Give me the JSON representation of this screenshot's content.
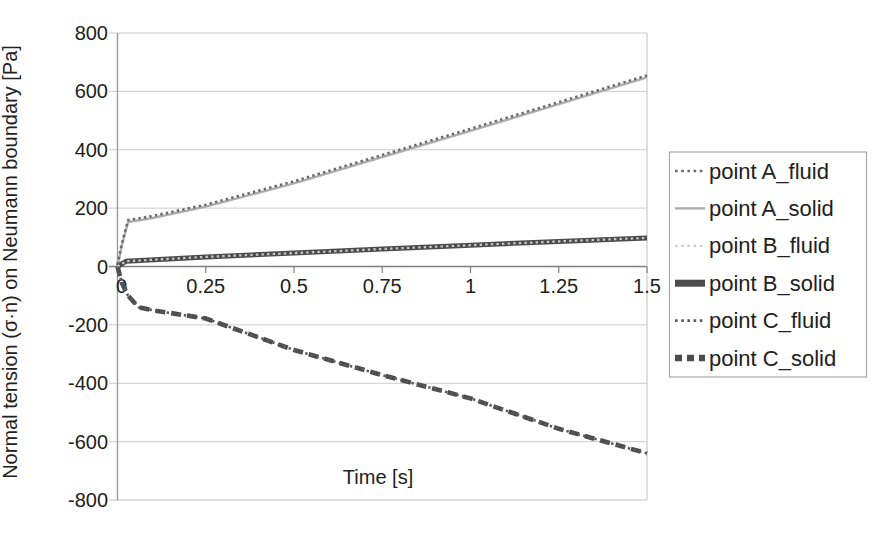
{
  "figure": {
    "background": "#ffffff",
    "text_color": "#212121",
    "axis_color": "#7f7f7f",
    "grid_color": "#cbcbcb",
    "border_color": "#c0c0c0"
  },
  "chart_data": {
    "type": "line",
    "title": "",
    "xlabel": "Time [s]",
    "ylabel": "Normal tension (σ·n) on Neumann boundary [Pa]",
    "xlim": [
      0,
      1.5
    ],
    "ylim": [
      -800,
      800
    ],
    "x_ticks": [
      0,
      0.25,
      0.5,
      0.75,
      1,
      1.25,
      1.5
    ],
    "y_ticks": [
      800,
      600,
      400,
      200,
      0,
      -200,
      -400,
      -600,
      -800
    ],
    "grid": "horizontal-only",
    "legend_position": "right-outside",
    "series": [
      {
        "name": "point A_fluid",
        "color": "#686868",
        "width": 2.6,
        "dash": "2.4 3.2",
        "offset_px": -2,
        "x": [
          0,
          0.012,
          0.03,
          0.1,
          0.25,
          0.5,
          0.75,
          1,
          1.25,
          1.5
        ],
        "y": [
          0,
          70,
          152,
          166,
          205,
          285,
          375,
          465,
          556,
          648
        ]
      },
      {
        "name": "point A_solid",
        "color": "#aeaeae",
        "width": 2.4,
        "dash": "",
        "offset_px": 0,
        "x": [
          0,
          0.012,
          0.03,
          0.1,
          0.25,
          0.5,
          0.75,
          1,
          1.25,
          1.5
        ],
        "y": [
          0,
          70,
          152,
          166,
          205,
          285,
          375,
          465,
          556,
          648
        ]
      },
      {
        "name": "point B_fluid",
        "color": "#c9c9c9",
        "width": 2.2,
        "dash": "2.4 3.2",
        "offset_px": 0,
        "x": [
          0,
          0.025,
          0.25,
          0.5,
          0.75,
          1,
          1.25,
          1.5
        ],
        "y": [
          0,
          18,
          33,
          46,
          60,
          73,
          86,
          98
        ]
      },
      {
        "name": "point B_solid",
        "color": "#4c4c4c",
        "width": 5,
        "dash": "",
        "offset_px": 0,
        "x": [
          0,
          0.025,
          0.25,
          0.5,
          0.75,
          1,
          1.25,
          1.5
        ],
        "y": [
          0,
          18,
          33,
          46,
          60,
          73,
          86,
          98
        ]
      },
      {
        "name": "point C_fluid",
        "color": "#5a5a5a",
        "width": 2.6,
        "dash": "2.4 3.4",
        "offset_px": 0,
        "x": [
          0,
          0.012,
          0.03,
          0.06,
          0.1,
          0.25,
          0.5,
          0.75,
          1,
          1.25,
          1.5
        ],
        "y": [
          0,
          -55,
          -100,
          -140,
          -150,
          -178,
          -286,
          -372,
          -452,
          -556,
          -640
        ]
      },
      {
        "name": "point C_solid",
        "color": "#4c4c4c",
        "width": 4.6,
        "dash": "10 6",
        "offset_px": 0,
        "x": [
          0,
          0.012,
          0.03,
          0.06,
          0.1,
          0.25,
          0.5,
          0.75,
          1,
          1.25,
          1.5
        ],
        "y": [
          0,
          -55,
          -100,
          -140,
          -150,
          -178,
          -286,
          -372,
          -452,
          -556,
          -640
        ]
      }
    ]
  }
}
